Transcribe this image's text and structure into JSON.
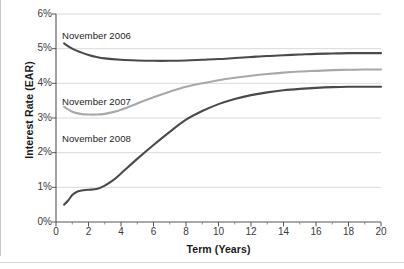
{
  "chart_data": {
    "type": "line",
    "title": "",
    "xlabel": "Term (Years)",
    "ylabel": "Interest Rate (EAR)",
    "xlim": [
      0,
      20
    ],
    "ylim": [
      0,
      6
    ],
    "grid": true,
    "legend_position": "inline-annotations",
    "xticks": [
      0,
      2,
      4,
      6,
      8,
      10,
      12,
      14,
      16,
      18,
      20
    ],
    "xtick_labels": [
      "0",
      "2",
      "4",
      "6",
      "8",
      "10",
      "12",
      "14",
      "16",
      "18",
      "20"
    ],
    "xminor_ticks": [
      1,
      3,
      5,
      7,
      9,
      11,
      13,
      15,
      17,
      19
    ],
    "yticks": [
      0,
      1,
      2,
      3,
      4,
      5,
      6
    ],
    "ytick_labels": [
      "0%",
      "1%",
      "2%",
      "3%",
      "4%",
      "5%",
      "6%"
    ],
    "series": [
      {
        "name": "November 2006",
        "color": "#4a4a4a",
        "width": 2.1,
        "x": [
          0.5,
          1,
          1.5,
          2,
          2.5,
          3,
          4,
          5,
          6,
          7,
          8,
          9,
          10,
          11,
          12,
          13,
          14,
          15,
          16,
          17,
          18,
          19,
          20
        ],
        "values": [
          5.15,
          5.0,
          4.9,
          4.82,
          4.76,
          4.72,
          4.68,
          4.66,
          4.65,
          4.65,
          4.66,
          4.68,
          4.7,
          4.73,
          4.76,
          4.79,
          4.81,
          4.83,
          4.85,
          4.86,
          4.87,
          4.87,
          4.87
        ]
      },
      {
        "name": "November 2007",
        "color": "#a8a8a8",
        "width": 2.1,
        "x": [
          0.5,
          1,
          1.5,
          2,
          2.5,
          3,
          3.5,
          4,
          5,
          6,
          7,
          8,
          9,
          10,
          11,
          12,
          13,
          14,
          15,
          16,
          17,
          18,
          19,
          20
        ],
        "values": [
          3.32,
          3.18,
          3.12,
          3.1,
          3.1,
          3.12,
          3.17,
          3.24,
          3.42,
          3.6,
          3.76,
          3.9,
          4.0,
          4.09,
          4.16,
          4.22,
          4.27,
          4.31,
          4.34,
          4.36,
          4.38,
          4.39,
          4.4,
          4.4
        ]
      },
      {
        "name": "November 2008",
        "color": "#4a4a4a",
        "width": 2.1,
        "x": [
          0.5,
          0.75,
          1,
          1.25,
          1.5,
          2,
          2.5,
          3,
          3.5,
          4,
          5,
          6,
          7,
          8,
          9,
          10,
          11,
          12,
          13,
          14,
          15,
          16,
          17,
          18,
          19,
          20
        ],
        "values": [
          0.5,
          0.62,
          0.78,
          0.86,
          0.9,
          0.93,
          0.95,
          1.05,
          1.2,
          1.4,
          1.82,
          2.22,
          2.6,
          2.95,
          3.2,
          3.4,
          3.55,
          3.66,
          3.74,
          3.8,
          3.84,
          3.87,
          3.89,
          3.9,
          3.9,
          3.9
        ]
      }
    ],
    "annotations": [
      {
        "text": "November 2006",
        "x_px": 62,
        "y_px": 30
      },
      {
        "text": "November 2007",
        "x_px": 62,
        "y_px": 96
      },
      {
        "text": "November 2008",
        "x_px": 62,
        "y_px": 133
      }
    ]
  }
}
